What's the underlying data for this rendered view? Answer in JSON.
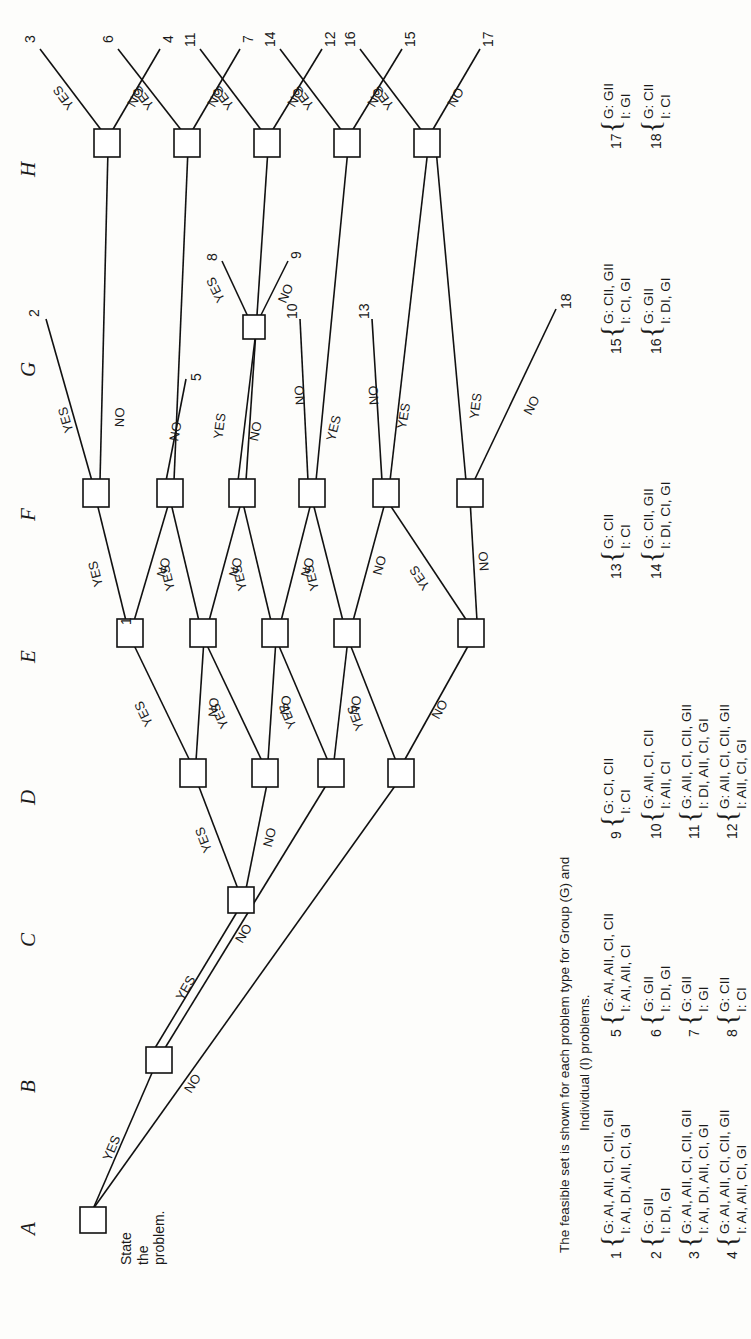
{
  "figure": {
    "column_headers": [
      "A",
      "B",
      "C",
      "D",
      "E",
      "F",
      "G",
      "H"
    ],
    "root_caption": "State\nthe\nproblem.",
    "edge_labels": {
      "yes": "YES",
      "no": "NO"
    },
    "note_line1": "The feasible set is shown for each problem type for Group (G) and",
    "note_line2": "Individual (I) problems."
  },
  "tree": {
    "edges": [
      {
        "from": "A",
        "label": "YES",
        "to": "B"
      },
      {
        "from": "A",
        "label": "NO",
        "to": "D1"
      },
      {
        "from": "B",
        "label": "YES",
        "to": "C"
      },
      {
        "from": "B",
        "label": "NO",
        "to": "D2"
      },
      {
        "from": "C",
        "label": "YES",
        "to": "D3"
      },
      {
        "from": "C",
        "label": "NO",
        "to": "D4"
      }
    ],
    "leaves": [
      "1",
      "2",
      "3",
      "4",
      "5",
      "6",
      "7",
      "8",
      "9",
      "10",
      "11",
      "12",
      "13",
      "14",
      "15",
      "16",
      "17",
      "18"
    ]
  },
  "legend": {
    "group_key": "G:",
    "individual_key": "I:",
    "items": [
      {
        "n": "1",
        "G": "G: AI, AII, CI, CII, GII",
        "I": "I:  AI, DI, AII, CI, GI"
      },
      {
        "n": "2",
        "G": "G: GII",
        "I": "I:  DI, GI"
      },
      {
        "n": "3",
        "G": "G: AI, AII, CI, CII, GII",
        "I": "I:  AI, DI, AII, CI, GI"
      },
      {
        "n": "4",
        "G": "G: AI, AII, CI, CII, GII",
        "I": "I:  AI, AII, CI, GI"
      },
      {
        "n": "5",
        "G": "G: AI, AII, CI, CII",
        "I": "I:  AI, AII, CI"
      },
      {
        "n": "6",
        "G": "G: GII",
        "I": "I:  DI, GI"
      },
      {
        "n": "7",
        "G": "G: GII",
        "I": "I:  GI"
      },
      {
        "n": "8",
        "G": "G: CII",
        "I": "I:  CI"
      },
      {
        "n": "9",
        "G": "G: CI, CII",
        "I": "I:  CI"
      },
      {
        "n": "10",
        "G": "G: AII, CI, CII",
        "I": "I:  AII, CI"
      },
      {
        "n": "11",
        "G": "G: AII, CI, CII, GII",
        "I": "I:  DI, AII, CI, GI"
      },
      {
        "n": "12",
        "G": "G: AII, CI, CII, GII",
        "I": "I:  AII, CI, GI"
      },
      {
        "n": "13",
        "G": "G: CII",
        "I": "I:  CI"
      },
      {
        "n": "14",
        "G": "G: CII, GII",
        "I": "I:  DI, CI, GI"
      },
      {
        "n": "15",
        "G": "G: CII, GII",
        "I": "I:  CI, GI"
      },
      {
        "n": "16",
        "G": "G: GII",
        "I": "I:  DI, GI"
      },
      {
        "n": "17",
        "G": "G: GII",
        "I": "I:  GI"
      },
      {
        "n": "18",
        "G": "G: CII",
        "I": "I:  CI"
      }
    ]
  },
  "colors": {
    "ink": "#111111",
    "paper": "#fdfdfb"
  }
}
